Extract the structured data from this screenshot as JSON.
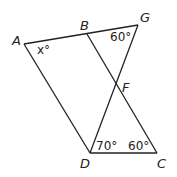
{
  "diagram": {
    "points": {
      "A": {
        "label": "A",
        "x": 24,
        "y": 44
      },
      "B": {
        "label": "B",
        "x": 87,
        "y": 34
      },
      "G": {
        "label": "G",
        "x": 138,
        "y": 25
      },
      "F": {
        "label": "F",
        "x": 116,
        "y": 86
      },
      "D": {
        "label": "D",
        "x": 90,
        "y": 153
      },
      "C": {
        "label": "C",
        "x": 157,
        "y": 153
      }
    },
    "angles": {
      "A": "x°",
      "G": "60°",
      "D": "70°",
      "C": "60°"
    }
  }
}
